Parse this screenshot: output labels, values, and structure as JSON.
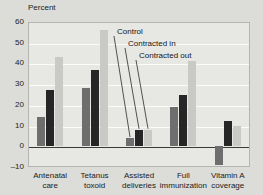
{
  "chart_data": {
    "type": "bar",
    "title": "",
    "ylabel": "Percent",
    "xlabel": "",
    "ylim": [
      -10,
      60
    ],
    "yticks": [
      -10,
      0,
      10,
      20,
      30,
      40,
      50,
      60
    ],
    "ytick_labels": [
      "–10",
      "0",
      "10",
      "20",
      "30",
      "40",
      "50",
      "60"
    ],
    "grid": true,
    "legend_position": "inside-annotations-with-leader-lines",
    "categories": [
      "Antenatal care",
      "Tetanus toxoid",
      "Assisted deliveries",
      "Full immunization",
      "Vitamin A coverage"
    ],
    "category_lines": [
      [
        "Antenatal",
        "care"
      ],
      [
        "Tetanus",
        "toxoid"
      ],
      [
        "Assisted",
        "deliveries"
      ],
      [
        "Full",
        "immunization"
      ],
      [
        "Vitamin A",
        "coverage"
      ]
    ],
    "series": [
      {
        "name": "Control",
        "color": "#6e6e6e",
        "values": [
          14,
          28,
          4,
          19,
          -9
        ]
      },
      {
        "name": "Contracted in",
        "color": "#262626",
        "values": [
          27,
          37,
          8,
          25,
          12
        ]
      },
      {
        "name": "Contracted out",
        "color": "#c9c9c6",
        "values": [
          43,
          56,
          8,
          41,
          10
        ]
      }
    ],
    "annotations": [
      {
        "text": "Control",
        "x": 117,
        "y": 27
      },
      {
        "text": "Contracted in",
        "x": 128,
        "y": 39
      },
      {
        "text": "Contracted out",
        "x": 139,
        "y": 51
      }
    ]
  },
  "colors": {
    "background": "#dcdcd9",
    "plot_background": "#e7e7e4",
    "gridline": "#fbfbfa",
    "axis": "#3a3a3a",
    "text": "#1b1b1b"
  }
}
